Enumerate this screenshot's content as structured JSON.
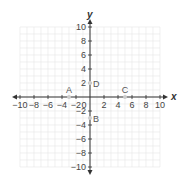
{
  "chart_data": {
    "type": "scatter",
    "title": "",
    "xlabel": "x",
    "ylabel": "y",
    "xlim": [
      -10,
      10
    ],
    "ylim": [
      -10,
      10
    ],
    "grid": true,
    "x_ticks": [
      -10,
      -8,
      -6,
      -4,
      -2,
      0,
      2,
      4,
      6,
      8,
      10
    ],
    "y_ticks": [
      -10,
      -8,
      -6,
      -4,
      -2,
      2,
      4,
      6,
      8,
      10
    ],
    "points": [
      {
        "label": "A",
        "x": -3,
        "y": 0
      },
      {
        "label": "B",
        "x": 0,
        "y": -3
      },
      {
        "label": "C",
        "x": 5,
        "y": 0
      },
      {
        "label": "D",
        "x": 0,
        "y": 2
      }
    ]
  },
  "colors": {
    "axis": "#333333",
    "grid": "#e6e6e6",
    "point": "#cccccc",
    "text": "#444444"
  }
}
